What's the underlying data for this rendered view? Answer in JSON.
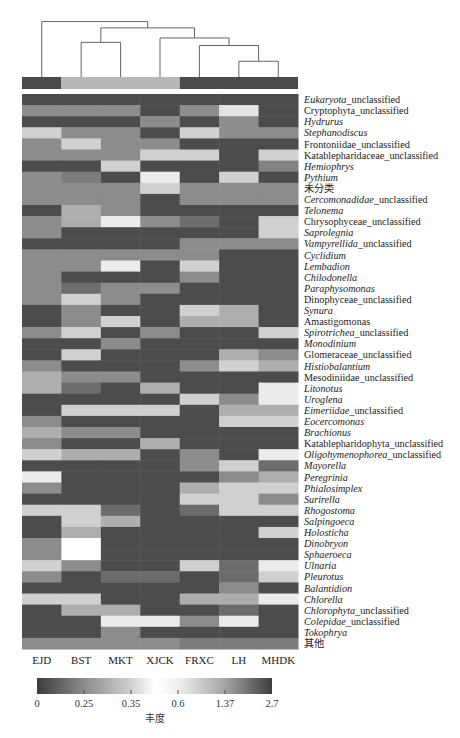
{
  "chart_data": {
    "type": "heatmap",
    "title": "",
    "columns": [
      "EJD",
      "BST",
      "MKT",
      "XJCK",
      "FRXC",
      "LH",
      "MHDK"
    ],
    "column_groups": [
      {
        "name": "group-1",
        "members": [
          "EJD"
        ],
        "color": "#4a4a4a"
      },
      {
        "name": "group-2",
        "members": [
          "BST",
          "MKT",
          "XJCK"
        ],
        "color": "#b8b8b8"
      },
      {
        "name": "group-3",
        "members": [
          "FRXC",
          "LH",
          "MHDK"
        ],
        "color": "#4a4a4a"
      }
    ],
    "dendrogram": {
      "leaves": [
        "EJD",
        "BST",
        "MKT",
        "XJCK",
        "FRXC",
        "LH",
        "MHDK"
      ],
      "merges": [
        {
          "left": "LH",
          "right": "MHDK",
          "height": 0.25
        },
        {
          "left": "FRXC",
          "right": "LH+MHDK",
          "height": 0.5
        },
        {
          "left": "BST",
          "right": "MKT",
          "height": 0.55
        },
        {
          "left": "XJCK",
          "right": "FRXC+LH+MHDK",
          "height": 0.62
        },
        {
          "left": "BST+MKT",
          "right": "XJCK+FRXC+LH+MHDK",
          "height": 0.78
        },
        {
          "left": "EJD",
          "right": "BST+MKT+XJCK+FRXC+LH+MHDK",
          "height": 0.88
        }
      ]
    },
    "rows": [
      {
        "italic": "Eukaryota",
        "plain": "_unclassified"
      },
      {
        "italic": "",
        "plain": "Cryptophyta_unclassified"
      },
      {
        "italic": "Hydrurus",
        "plain": ""
      },
      {
        "italic": "Stephanodiscus",
        "plain": ""
      },
      {
        "italic": "",
        "plain": "Frontoniidae_unclassified"
      },
      {
        "italic": "",
        "plain": "Katablepharidaceae_unclassified"
      },
      {
        "italic": "Hemiophrys",
        "plain": ""
      },
      {
        "italic": "Pythium",
        "plain": ""
      },
      {
        "italic": "",
        "plain": "未分类"
      },
      {
        "italic": "Cercomonadidae",
        "plain": "_unclassified"
      },
      {
        "italic": "Telonema",
        "plain": ""
      },
      {
        "italic": "",
        "plain": "Chrysophyceae_unclassified"
      },
      {
        "italic": "Saprolegnia",
        "plain": ""
      },
      {
        "italic": "Vampyrellida",
        "plain": "_unclassified"
      },
      {
        "italic": "Cyclidium",
        "plain": ""
      },
      {
        "italic": "Lembadion",
        "plain": ""
      },
      {
        "italic": "Chilodonella",
        "plain": ""
      },
      {
        "italic": "Paraphysomonas",
        "plain": ""
      },
      {
        "italic": "",
        "plain": "Dinophyceae_unclassified"
      },
      {
        "italic": "Synura",
        "plain": ""
      },
      {
        "italic": "",
        "plain": "Amastigomonas"
      },
      {
        "italic": "Spirotrichea",
        "plain": "_unclassified"
      },
      {
        "italic": "Monodinium",
        "plain": ""
      },
      {
        "italic": "",
        "plain": "Glomeraceae_unclassified"
      },
      {
        "italic": "Histiobalantium",
        "plain": ""
      },
      {
        "italic": "",
        "plain": "Mesodiniidae_unclassified"
      },
      {
        "italic": "Litonotus",
        "plain": ""
      },
      {
        "italic": "Uroglena",
        "plain": ""
      },
      {
        "italic": "Eimeriidae",
        "plain": "_unclassified"
      },
      {
        "italic": "Eocercomonas",
        "plain": ""
      },
      {
        "italic": "Brachionus",
        "plain": ""
      },
      {
        "italic": "",
        "plain": "Katablepharidophyta_unclassified"
      },
      {
        "italic": "Oligohymenophorea",
        "plain": "_unclassified"
      },
      {
        "italic": "Mayorella",
        "plain": ""
      },
      {
        "italic": "Peregrinia",
        "plain": ""
      },
      {
        "italic": "Phialosimplex",
        "plain": ""
      },
      {
        "italic": "Surirella",
        "plain": ""
      },
      {
        "italic": "Rhogostoma",
        "plain": ""
      },
      {
        "italic": "Salpingoeca",
        "plain": ""
      },
      {
        "italic": "Holosticha",
        "plain": ""
      },
      {
        "italic": "Dinobryon",
        "plain": ""
      },
      {
        "italic": "Sphaeroeca",
        "plain": ""
      },
      {
        "italic": "Ulnaria",
        "plain": ""
      },
      {
        "italic": "Pleurotus",
        "plain": ""
      },
      {
        "italic": "Balantidion",
        "plain": ""
      },
      {
        "italic": "Chlorella",
        "plain": ""
      },
      {
        "italic": "Chlorophyta",
        "plain": "_unclassified"
      },
      {
        "italic": "Colepidae",
        "plain": "_unclassified"
      },
      {
        "italic": "Tokophrya",
        "plain": ""
      },
      {
        "italic": "",
        "plain": "其他"
      }
    ],
    "values": [
      [
        0.05,
        0.05,
        0.05,
        0.05,
        0.05,
        0.05,
        0.05
      ],
      [
        0.25,
        0.25,
        0.25,
        0.05,
        0.25,
        0.4,
        0.05
      ],
      [
        0.05,
        0.05,
        0.05,
        0.25,
        0.05,
        0.25,
        0.05
      ],
      [
        0.35,
        0.25,
        0.25,
        0.05,
        0.35,
        0.25,
        0.25
      ],
      [
        0.25,
        0.35,
        0.25,
        0.25,
        0.05,
        0.05,
        0.05
      ],
      [
        0.25,
        0.25,
        0.25,
        0.35,
        0.35,
        0.05,
        0.35
      ],
      [
        0.05,
        0.05,
        0.35,
        0.05,
        0.05,
        0.05,
        0.22
      ],
      [
        0.25,
        0.2,
        0.05,
        0.42,
        0.05,
        0.35,
        0.05
      ],
      [
        0.25,
        0.25,
        0.25,
        0.35,
        0.25,
        0.25,
        0.25
      ],
      [
        0.25,
        0.25,
        0.25,
        0.05,
        0.25,
        0.25,
        0.25
      ],
      [
        0.05,
        0.3,
        0.25,
        0.05,
        0.05,
        0.05,
        0.05
      ],
      [
        0.25,
        0.3,
        0.42,
        0.25,
        0.15,
        0.05,
        0.35
      ],
      [
        0.25,
        0.05,
        0.05,
        0.05,
        0.05,
        0.05,
        0.35
      ],
      [
        0.05,
        0.05,
        0.05,
        0.05,
        0.25,
        0.25,
        0.25
      ],
      [
        0.25,
        0.25,
        0.25,
        0.25,
        0.25,
        0.05,
        0.05
      ],
      [
        0.25,
        0.25,
        0.42,
        0.05,
        0.35,
        0.05,
        0.05
      ],
      [
        0.25,
        0.05,
        0.05,
        0.05,
        0.25,
        0.05,
        0.05
      ],
      [
        0.25,
        0.15,
        0.25,
        0.25,
        0.05,
        0.05,
        0.05
      ],
      [
        0.25,
        0.35,
        0.25,
        0.05,
        0.05,
        0.05,
        0.05
      ],
      [
        0.05,
        0.25,
        0.05,
        0.05,
        0.35,
        0.3,
        0.05
      ],
      [
        0.05,
        0.25,
        0.35,
        0.05,
        0.3,
        0.3,
        0.05
      ],
      [
        0.25,
        0.35,
        0.05,
        0.25,
        0.05,
        0.05,
        0.35
      ],
      [
        0.05,
        0.05,
        0.25,
        0.05,
        0.05,
        0.05,
        0.05
      ],
      [
        0.05,
        0.35,
        0.05,
        0.05,
        0.05,
        0.3,
        0.25
      ],
      [
        0.25,
        0.05,
        0.05,
        0.05,
        0.25,
        0.35,
        0.3
      ],
      [
        0.3,
        0.25,
        0.25,
        0.05,
        0.05,
        0.05,
        0.05
      ],
      [
        0.3,
        0.15,
        0.05,
        0.3,
        0.05,
        0.05,
        0.42
      ],
      [
        0.05,
        0.05,
        0.05,
        0.05,
        0.35,
        0.25,
        0.42
      ],
      [
        0.05,
        0.35,
        0.35,
        0.35,
        0.05,
        0.3,
        0.3
      ],
      [
        0.25,
        0.05,
        0.05,
        0.05,
        0.05,
        0.35,
        0.35
      ],
      [
        0.3,
        0.25,
        0.25,
        0.05,
        0.05,
        0.05,
        0.05
      ],
      [
        0.25,
        0.05,
        0.05,
        0.3,
        0.05,
        0.05,
        0.05
      ],
      [
        0.35,
        0.3,
        0.3,
        0.05,
        0.25,
        0.05,
        0.42
      ],
      [
        0.05,
        0.05,
        0.05,
        0.05,
        0.25,
        0.35,
        0.15
      ],
      [
        0.42,
        0.05,
        0.05,
        0.05,
        0.05,
        0.25,
        0.3
      ],
      [
        0.25,
        0.05,
        0.05,
        0.05,
        0.3,
        0.35,
        0.35
      ],
      [
        0.05,
        0.05,
        0.05,
        0.05,
        0.35,
        0.35,
        0.25
      ],
      [
        0.35,
        0.35,
        0.15,
        0.05,
        0.15,
        0.35,
        0.35
      ],
      [
        0.05,
        0.35,
        0.3,
        0.05,
        0.05,
        0.05,
        0.05
      ],
      [
        0.05,
        0.3,
        0.05,
        0.05,
        0.05,
        0.05,
        0.35
      ],
      [
        0.25,
        0.47,
        0.05,
        0.05,
        0.05,
        0.05,
        0.05
      ],
      [
        0.25,
        0.47,
        0.05,
        0.05,
        0.05,
        0.05,
        0.05
      ],
      [
        0.35,
        0.25,
        0.05,
        0.05,
        0.35,
        0.15,
        0.42
      ],
      [
        0.25,
        0.05,
        0.15,
        0.15,
        0.05,
        0.15,
        0.35
      ],
      [
        0.05,
        0.05,
        0.05,
        0.05,
        0.05,
        0.25,
        0.05
      ],
      [
        0.35,
        0.35,
        0.05,
        0.05,
        0.3,
        0.3,
        0.42
      ],
      [
        0.05,
        0.3,
        0.3,
        0.05,
        0.05,
        0.15,
        0.05
      ],
      [
        0.05,
        0.05,
        0.42,
        0.42,
        0.25,
        0.42,
        0.05
      ],
      [
        0.05,
        0.05,
        0.25,
        0.05,
        0.05,
        0.05,
        0.05
      ],
      [
        0.25,
        0.25,
        0.25,
        0.25,
        0.2,
        0.2,
        0.2
      ]
    ],
    "colorbar": {
      "label": "丰度",
      "ticks": [
        "0",
        "0.25",
        "0.35",
        "0.6",
        "1.37",
        "2.7"
      ],
      "tick_values": [
        0,
        0.25,
        0.35,
        0.6,
        1.37,
        2.7
      ],
      "colors": [
        "#3c3c3c",
        "#8c8c8c",
        "#d0d0d0",
        "#f6f6f6",
        "#a4a4a4",
        "#3e3e3e"
      ],
      "range": [
        0,
        2.7
      ]
    },
    "xlabel": "",
    "ylabel": "",
    "legend": "bottom"
  }
}
